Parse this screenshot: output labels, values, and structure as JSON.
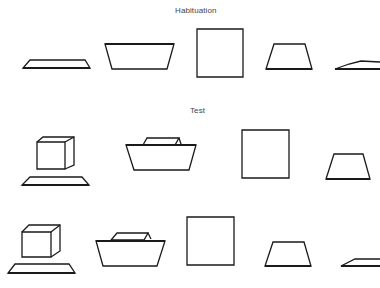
{
  "sections": {
    "habituation": {
      "title": "Habituation"
    },
    "test": {
      "title": "Test"
    }
  },
  "colors": {
    "stroke": "#1a1a1a",
    "label": "#444444",
    "background": "#ffffff"
  },
  "rows": [
    {
      "name": "habituation-row",
      "items": [
        "flat-slab",
        "wide-trapezoid",
        "square-face",
        "small-trapezoid",
        "thin-slab-partial"
      ]
    },
    {
      "name": "test-row-1",
      "items": [
        "cube-above-slab",
        "small-block-on-trapezoid",
        "square-face",
        "small-trapezoid"
      ]
    },
    {
      "name": "test-row-2",
      "items": [
        "cube-above-slab",
        "small-block-on-trapezoid",
        "square-face",
        "small-trapezoid",
        "thin-slab-partial"
      ]
    }
  ]
}
